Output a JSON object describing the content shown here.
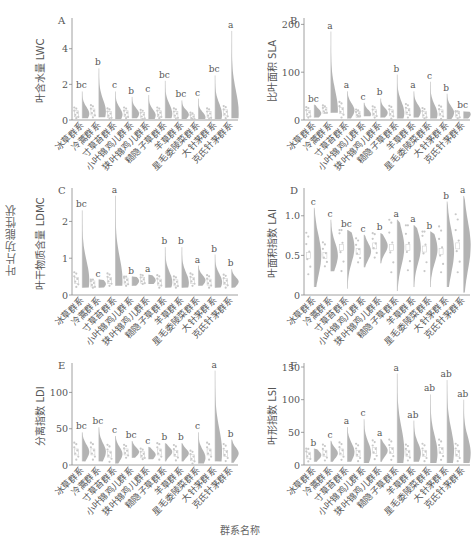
{
  "figure": {
    "shared_ylabel": "叶片功能性状",
    "shared_xlabel": "群系名称"
  },
  "categories": [
    "冰草群系",
    "冷蒿群系",
    "寸草苔群系",
    "小叶锦鸡儿群系",
    "狭叶锦鸡儿群系",
    "糙隐子草群系",
    "羊草群系",
    "星毛委陵菜群系",
    "大针茅群系",
    "克氏针茅群系"
  ],
  "colors": {
    "violin": "#9a9a9a",
    "points": "#c8c8c8",
    "axis": "#888888",
    "text": "#555555"
  },
  "chart_data": [
    {
      "type": "violin",
      "panel": "A",
      "ylabel": "叶含水量 LWC",
      "ylim": [
        0,
        5.5
      ],
      "yticks": [
        0,
        2,
        4
      ],
      "categories": [
        "冰草群系",
        "冷蒿群系",
        "寸草苔群系",
        "小叶锦鸡儿群系",
        "狭叶锦鸡儿群系",
        "糙隐子草群系",
        "羊草群系",
        "星毛委陵菜群系",
        "大针茅群系",
        "克氏针茅群系"
      ],
      "max": [
        1.6,
        2.9,
        1.6,
        1.3,
        1.4,
        2.2,
        1.1,
        1.2,
        2.5,
        5.0
      ],
      "min": [
        0.1,
        0.15,
        0.05,
        0.1,
        0.05,
        0.1,
        0.05,
        0.05,
        0.05,
        0.1
      ],
      "median": [
        0.35,
        0.45,
        0.3,
        0.35,
        0.25,
        0.35,
        0.3,
        0.15,
        0.3,
        0.4
      ],
      "letters": [
        "bc",
        "b",
        "c",
        "b",
        "c",
        "bc",
        "bc",
        "c",
        "bc",
        "a"
      ]
    },
    {
      "type": "violin",
      "panel": "B",
      "ylabel": "比叶面积 SLA",
      "ylim": [
        0,
        205
      ],
      "yticks": [
        0,
        100,
        200
      ],
      "categories": [
        "冰草群系",
        "冷蒿群系",
        "寸草苔群系",
        "小叶锦鸡儿群系",
        "狭叶锦鸡儿群系",
        "糙隐子草群系",
        "羊草群系",
        "星毛委陵菜群系",
        "大针茅群系",
        "克氏针茅群系"
      ],
      "max": [
        32,
        185,
        60,
        36,
        45,
        95,
        60,
        80,
        55,
        18
      ],
      "min": [
        5,
        15,
        3,
        8,
        5,
        3,
        5,
        3,
        2,
        3
      ],
      "median": [
        14,
        20,
        20,
        12,
        15,
        15,
        18,
        12,
        15,
        12
      ],
      "letters": [
        "bc",
        "a",
        "a",
        "c",
        "b",
        "b",
        "a",
        "c",
        "b",
        "bc"
      ]
    },
    {
      "type": "violin",
      "panel": "C",
      "ylabel": "叶干物质含量 LDMC",
      "ylim": [
        0,
        2.8
      ],
      "yticks": [
        0,
        1,
        2
      ],
      "categories": [
        "冰草群系",
        "冷蒿群系",
        "寸草苔群系",
        "小叶锦鸡儿群系",
        "狭叶锦鸡儿群系",
        "糙隐子草群系",
        "羊草群系",
        "星毛委陵菜群系",
        "大针茅群系",
        "克氏针茅群系"
      ],
      "max": [
        2.3,
        0.42,
        2.7,
        0.5,
        0.55,
        1.3,
        1.3,
        0.8,
        1.1,
        0.7
      ],
      "min": [
        0.2,
        0.2,
        0.25,
        0.25,
        0.3,
        0.2,
        0.2,
        0.25,
        0.2,
        0.2
      ],
      "median": [
        0.4,
        0.3,
        0.4,
        0.38,
        0.4,
        0.35,
        0.33,
        0.4,
        0.35,
        0.36
      ],
      "letters": [
        "bc",
        "c",
        "a",
        "b",
        "a",
        "b",
        "b",
        "a",
        "b",
        "b"
      ]
    },
    {
      "type": "violin",
      "panel": "D",
      "ylabel": "叶面积指数 LAI",
      "ylim": [
        0,
        1.3
      ],
      "yticks": [
        "0",
        "0.5",
        "1.0"
      ],
      "ytick_values": [
        0,
        0.5,
        1.0
      ],
      "categories": [
        "冰草群系",
        "冷蒿群系",
        "寸草苔群系",
        "小叶锦鸡儿群系",
        "狭叶锦鸡儿群系",
        "糙隐子草群系",
        "羊草群系",
        "星毛委陵菜群系",
        "大针茅群系",
        "克氏针茅群系"
      ],
      "max": [
        1.1,
        0.95,
        0.82,
        0.76,
        0.78,
        0.95,
        0.88,
        0.8,
        1.18,
        1.25
      ],
      "min": [
        0.1,
        0.3,
        0.08,
        0.35,
        0.4,
        0.05,
        0.1,
        0.1,
        0.1,
        0.03
      ],
      "median": [
        0.5,
        0.5,
        0.6,
        0.55,
        0.62,
        0.6,
        0.6,
        0.58,
        0.55,
        0.62
      ],
      "letters": [
        "c",
        "c",
        "bc",
        "c",
        "b",
        "a",
        "a",
        "b",
        "b",
        "a"
      ]
    },
    {
      "type": "violin",
      "panel": "E",
      "ylabel": "分离指数 LDI",
      "ylim": [
        0,
        135
      ],
      "yticks": [
        0,
        50,
        100
      ],
      "categories": [
        "冰草群系",
        "冷蒿群系",
        "寸草苔群系",
        "小叶锦鸡儿群系",
        "狭叶锦鸡儿群系",
        "糙隐子草群系",
        "羊草群系",
        "星毛委陵菜群系",
        "大针茅群系",
        "克氏针茅群系"
      ],
      "max": [
        45,
        52,
        40,
        33,
        25,
        30,
        30,
        45,
        130,
        35
      ],
      "min": [
        5,
        5,
        2,
        10,
        8,
        5,
        5,
        2,
        5,
        3
      ],
      "median": [
        18,
        18,
        15,
        18,
        14,
        18,
        16,
        10,
        18,
        16
      ],
      "letters": [
        "bc",
        "bc",
        "c",
        "bc",
        "c",
        "b",
        "b",
        "c",
        "a",
        "b"
      ]
    },
    {
      "type": "violin",
      "panel": "F",
      "ylabel": "叶形指数 LSI",
      "ylim": [
        0,
        150
      ],
      "yticks": [
        0,
        50,
        100,
        150
      ],
      "categories": [
        "冰草群系",
        "冷蒿群系",
        "寸草苔群系",
        "小叶锦鸡儿群系",
        "狭叶锦鸡儿群系",
        "糙隐子草群系",
        "羊草群系",
        "星毛委陵菜群系",
        "大针茅群系",
        "克氏针茅群系"
      ],
      "max": [
        25,
        37,
        58,
        70,
        40,
        140,
        68,
        108,
        130,
        100
      ],
      "min": [
        5,
        5,
        5,
        3,
        5,
        3,
        5,
        3,
        3,
        3
      ],
      "median": [
        15,
        18,
        20,
        18,
        22,
        22,
        18,
        18,
        22,
        18
      ],
      "letters": [
        "b",
        "c",
        "a",
        "c",
        "a",
        "a",
        "ab",
        "ab",
        "ab",
        "ab"
      ]
    }
  ]
}
